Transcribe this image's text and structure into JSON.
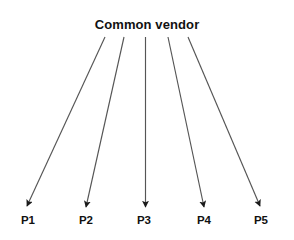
{
  "diagram": {
    "type": "fan-out-arrow-diagram",
    "background_color": "#ffffff",
    "line_color": "#555555",
    "text_color": "#111111",
    "source": {
      "label": "Common vendor"
    },
    "targets": [
      {
        "label": "P1"
      },
      {
        "label": "P2"
      },
      {
        "label": "P3"
      },
      {
        "label": "P4"
      },
      {
        "label": "P5"
      }
    ],
    "arrows": [
      {
        "from": "Common vendor",
        "to": "P1"
      },
      {
        "from": "Common vendor",
        "to": "P2"
      },
      {
        "from": "Common vendor",
        "to": "P3"
      },
      {
        "from": "Common vendor",
        "to": "P4"
      },
      {
        "from": "Common vendor",
        "to": "P5"
      }
    ]
  }
}
